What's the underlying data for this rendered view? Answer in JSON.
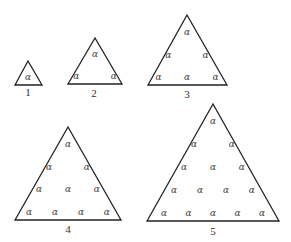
{
  "figure": {
    "symbol": "α",
    "stroke_color": "#222222",
    "symbol_color": "#444444",
    "triangles": [
      {
        "label": "1",
        "rows": [
          1
        ]
      },
      {
        "label": "2",
        "rows": [
          1,
          2
        ]
      },
      {
        "label": "3",
        "rows": [
          1,
          2,
          3
        ]
      },
      {
        "label": "4",
        "rows": [
          1,
          2,
          3,
          4
        ]
      },
      {
        "label": "5",
        "rows": [
          1,
          2,
          3,
          4,
          5
        ]
      }
    ]
  }
}
